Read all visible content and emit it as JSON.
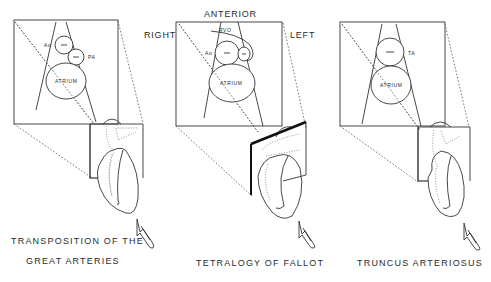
{
  "figure": {
    "orientation_labels": {
      "anterior": "ANTERIOR",
      "right": "RIGHT",
      "left": "LEFT"
    },
    "panels": [
      {
        "id": "tga",
        "caption_line1": "TRANSPOSITION OF THE",
        "caption_line2": "GREAT ARTERIES",
        "structures": {
          "vessel_1": "Ao",
          "vessel_2": "PA",
          "atrium": "ATRIUM",
          "vessel_mark": "—"
        }
      },
      {
        "id": "tof",
        "caption_line1": "TETRALOGY OF FALLOT",
        "structures": {
          "outflow": "RVO",
          "vessel_1": "Ao",
          "atrium": "ATRIUM",
          "vessel_mark": "—"
        }
      },
      {
        "id": "truncus",
        "caption_line1": "TRUNCUS ARTERIOSUS",
        "structures": {
          "vessel_1": "TA",
          "atrium": "ATRIUM",
          "vessel_mark": "—"
        }
      }
    ],
    "colors": {
      "background": "#ffffff",
      "ink": "#2a2a2a"
    }
  }
}
